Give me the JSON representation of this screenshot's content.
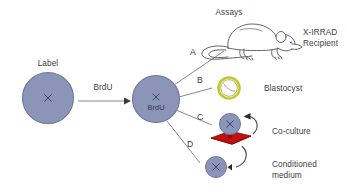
{
  "figure": {
    "background_color": "#ffffff",
    "text_color": "#3d3d3d"
  },
  "colors": {
    "cell_fill": "#8b95b8",
    "cell_stroke": "#6b77a0",
    "cell_mark": "#3f4866",
    "blastocyst_ring": "#c6c733",
    "blastocyst_inner": "#9a9b2a",
    "feeder_red": "#c01010",
    "feeder_red_dark": "#8e0b0b",
    "line": "#8a8a8a",
    "arrow": "#8a8a8a",
    "mouse_outline": "#4a4a4a"
  },
  "nodes": {
    "label_cell": {
      "caption": "Label",
      "mark": "×"
    },
    "brdu_cell": {
      "mark": "×",
      "caption": "BrdU"
    },
    "transform_arrow": {
      "label": "BrdU"
    }
  },
  "assays_header": "Assays",
  "branches": [
    {
      "letter": "A",
      "target_label": "X-IRRAD\nRecipient",
      "target_line1": "X-IRRAD",
      "target_line2": "Recipient",
      "icon": "mouse-illustration"
    },
    {
      "letter": "B",
      "target_label": "Blastocyst",
      "target_line1": "Blastocyst",
      "target_line2": "",
      "icon": "blastocyst-ring"
    },
    {
      "letter": "C",
      "target_label": "Co-culture",
      "target_line1": "Co-culture",
      "target_line2": "",
      "icon": "co-culture-feeder"
    },
    {
      "letter": "D",
      "target_label": "Conditioned\nmedium",
      "target_line1": "Conditioned",
      "target_line2": "medium",
      "icon": "conditioned-medium-cell"
    }
  ]
}
